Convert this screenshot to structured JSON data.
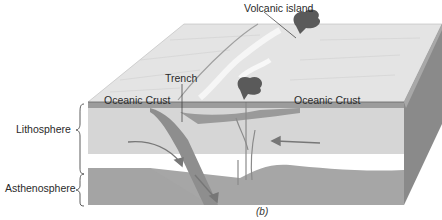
{
  "figure": {
    "caption": "(b)",
    "labels": {
      "volcanic_island": "Volcanic island",
      "trench": "Trench",
      "oceanic_crust_left": "Oceanic Crust",
      "oceanic_crust_right": "Oceanic Crust",
      "lithosphere": "Lithosphere",
      "asthenosphere": "Asthenosphere"
    },
    "colors": {
      "surface": "#e6e6e6",
      "crust": "#9a9a9a",
      "lithosphere": "#d4d4d4",
      "asthenosphere": "#a8a8a8",
      "side_face": "#8c8c8c",
      "volcano": "#555555",
      "arrow": "#777777"
    }
  }
}
